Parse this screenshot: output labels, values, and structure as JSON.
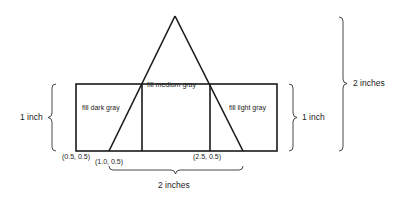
{
  "diagram": {
    "type": "geometry-sketch",
    "colors": {
      "stroke": "#1a1a1a",
      "text": "#222222",
      "background": "#ffffff"
    },
    "regions": {
      "left": "fill dark gray",
      "center": "fill medium gray",
      "right": "fill light gray"
    },
    "points": {
      "p1": "(0.5, 0.5)",
      "p2": "(1.0, 0.5)",
      "p3": "(2.5, 0.5)"
    },
    "dimensions": {
      "left_height": "1 inch",
      "right_height": "1 inch",
      "total_height": "2 inches",
      "base_width": "2 inches"
    }
  }
}
